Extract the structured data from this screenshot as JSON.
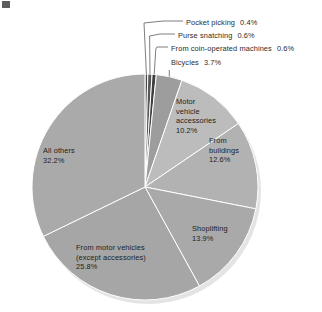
{
  "figure": {
    "background_color": "#ffffff",
    "text_color": "#2b2b2b",
    "divider_color": "#ffffff",
    "leader_color": "#6f6f6f"
  },
  "chart_data": {
    "type": "pie",
    "title": "",
    "subtitle": "",
    "xlabel": "",
    "ylabel": "",
    "legend_position": "none",
    "grid": false,
    "units": "percent",
    "total": 100.0,
    "start_angle_deg": -90,
    "direction": "clockwise",
    "center_px": [
      145,
      187
    ],
    "radius_px": 113,
    "categories": [
      "Pocket picking",
      "Purse snatching",
      "From coin-operated machines",
      "Bicycles",
      "Motor vehicle accessories",
      "From buildings",
      "Shoplifting",
      "From motor vehicles (except accessories)",
      "All others"
    ],
    "values": [
      0.4,
      0.6,
      0.6,
      3.7,
      10.2,
      12.6,
      13.9,
      25.8,
      32.2
    ],
    "slices": [
      {
        "name": "Pocket picking",
        "value": 0.4,
        "value_label": "0.4%",
        "color": "#4a4a4a",
        "label_mode": "callout"
      },
      {
        "name": "Purse snatching",
        "value": 0.6,
        "value_label": "0.6%",
        "color": "#585858",
        "label_mode": "callout"
      },
      {
        "name": "From coin-operated machines",
        "value": 0.6,
        "value_label": "0.6%",
        "color": "#3f3f3f",
        "label_mode": "callout"
      },
      {
        "name": "Bicycles",
        "value": 3.7,
        "value_label": "3.7%",
        "color": "#9d9d9d",
        "label_mode": "callout"
      },
      {
        "name": "Motor vehicle accessories",
        "value": 10.2,
        "value_label": "10.2%",
        "color": "#bcbcbc",
        "label_mode": "inside"
      },
      {
        "name": "From buildings",
        "value": 12.6,
        "value_label": "12.6%",
        "color": "#b2b2b2",
        "label_mode": "inside"
      },
      {
        "name": "Shoplifting",
        "value": 13.9,
        "value_label": "13.9%",
        "color": "#a9a9a9",
        "label_mode": "inside"
      },
      {
        "name": "From motor vehicles (except accessories)",
        "value": 25.8,
        "value_label": "25.8%",
        "color": "#a6a6a6",
        "label_mode": "inside"
      },
      {
        "name": "All others",
        "value": 32.2,
        "value_label": "32.2%",
        "color": "#aaaaaa",
        "label_mode": "inside"
      }
    ]
  },
  "callouts": [
    {
      "name": "Pocket picking",
      "text": "Pocket picking",
      "value_label": "0.4%"
    },
    {
      "name": "Purse snatching",
      "text": "Purse snatching",
      "value_label": "0.6%"
    },
    {
      "name": "From coin-operated machines",
      "text": "From coin-operated machines",
      "value_label": "0.6%"
    },
    {
      "name": "Bicycles",
      "text": "Bicycles",
      "value_label": "3.7%"
    }
  ],
  "inside_labels": {
    "motor_vehicle_accessories": "Motor\nvehicle\naccessories\n10.2%",
    "from_buildings": "From\nbuildings\n12.6%",
    "shoplifting": "Shoplifting\n13.9%",
    "from_motor_vehicles": "From motor vehicles\n(except accessories)\n25.8%",
    "all_others": "All others\n32.2%"
  }
}
